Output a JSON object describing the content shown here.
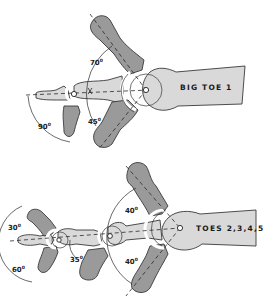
{
  "figure": {
    "panels": [
      {
        "id": "big-toe",
        "title": "BIG TOE 1",
        "angles": {
          "mtp_extension": "70",
          "mtp_flexion": "45",
          "ip_flexion": "90"
        }
      },
      {
        "id": "lesser-toes",
        "title": "TOES 2,3,4,5",
        "angles": {
          "mtp_extension": "40",
          "mtp_flexion": "40",
          "pip_flexion": "35",
          "dip_extension": "30",
          "dip_flexion": "60"
        }
      }
    ],
    "degree_symbol": "0",
    "colors": {
      "bone_light": "#d9d9d9",
      "bone_dark": "#9a9a9a",
      "outline": "#3a3a3a"
    }
  }
}
